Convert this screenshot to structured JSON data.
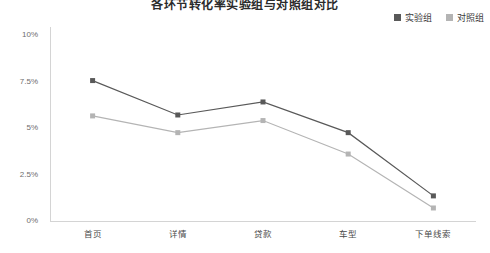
{
  "chart_data": {
    "type": "line",
    "title": "各环节转化率实验组与对照组对比",
    "categories": [
      "首页",
      "详情",
      "贷款",
      "车型",
      "下单线索"
    ],
    "series": [
      {
        "name": "实验组",
        "color": "#595959",
        "values": [
          7.55,
          5.7,
          6.4,
          4.75,
          1.35
        ]
      },
      {
        "name": "对照组",
        "color": "#b4b4b4",
        "values": [
          5.65,
          4.75,
          5.4,
          3.6,
          0.7
        ]
      }
    ],
    "ylabel": "",
    "xlabel": "",
    "ylim": [
      0,
      10
    ],
    "yticks": [
      0,
      2.5,
      5,
      7.5,
      10
    ],
    "ytick_labels": [
      "0%",
      "2.5%",
      "5%",
      "7.5%",
      "10%"
    ],
    "grid": false,
    "legend_position": "top-right",
    "value_suffix": "%"
  },
  "legend": {
    "items": [
      {
        "label": "实验组",
        "color": "#595959"
      },
      {
        "label": "对照组",
        "color": "#b4b4b4"
      }
    ]
  },
  "axis": {
    "y_axis_color": "#d4d4d4",
    "x_axis_color": "#d4d4d4"
  }
}
